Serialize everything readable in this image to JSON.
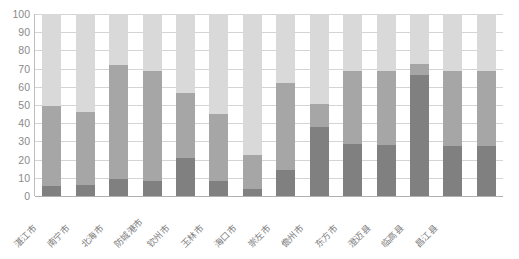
{
  "chart_data": {
    "type": "bar",
    "subtype": "stacked-bar-100-percent",
    "title": "",
    "subtitle": "",
    "xlabel": "",
    "ylabel": "",
    "ylim": [
      0,
      100
    ],
    "ytick_values": [
      0,
      10,
      20,
      30,
      40,
      50,
      60,
      70,
      80,
      90,
      100
    ],
    "ytick_labels": [
      "0",
      "10",
      "20",
      "30",
      "40",
      "50",
      "60",
      "70",
      "80",
      "90",
      "100"
    ],
    "grid": true,
    "grid_axis": "y",
    "legend": false,
    "legend_position": "none",
    "categories": [
      "湛江市",
      "南宁市",
      "北海市",
      "防城港市",
      "钦州市",
      "玉林市",
      "海口市",
      "崇左市",
      "儋州市",
      "东方市",
      "澄迈县",
      "临高县",
      "昌江县"
    ],
    "series": [
      {
        "name": "series-1",
        "color": "#808080",
        "values": [
          5.5,
          6,
          9.5,
          8.5,
          21,
          8,
          4,
          14.5,
          38,
          28.5,
          28,
          66.5,
          27.5
        ]
      },
      {
        "name": "series-2",
        "color": "#a6a6a6",
        "values": [
          44,
          40,
          62.5,
          60,
          35.5,
          37,
          18.5,
          47.5,
          12.5,
          40,
          40.5,
          6,
          41
        ]
      },
      {
        "name": "series-3",
        "color": "#d9d9d9",
        "values": [
          50.5,
          54,
          28,
          31.5,
          43.5,
          55,
          77.5,
          38,
          49.5,
          31.5,
          31.5,
          27.5,
          31.5
        ]
      }
    ],
    "cumulative_tops": [
      {
        "category": "湛江市",
        "seg1_top": 5.5,
        "seg2_top": 49.5,
        "seg3_top": 100
      },
      {
        "category": "南宁市",
        "seg1_top": 6,
        "seg2_top": 46,
        "seg3_top": 100
      },
      {
        "category": "北海市",
        "seg1_top": 9.5,
        "seg2_top": 72,
        "seg3_top": 100
      },
      {
        "category": "防城港市",
        "seg1_top": 8.5,
        "seg2_top": 68.5,
        "seg3_top": 100
      },
      {
        "category": "钦州市",
        "seg1_top": 21,
        "seg2_top": 56.5,
        "seg3_top": 100
      },
      {
        "category": "玉林市",
        "seg1_top": 8,
        "seg2_top": 45,
        "seg3_top": 100
      },
      {
        "category": "海口市",
        "seg1_top": 4,
        "seg2_top": 22.5,
        "seg3_top": 100
      },
      {
        "category": "崇左市",
        "seg1_top": 14.5,
        "seg2_top": 62,
        "seg3_top": 100
      },
      {
        "category": "儋州市",
        "seg1_top": 38,
        "seg2_top": 50.5,
        "seg3_top": 100
      },
      {
        "category": "东方市",
        "seg1_top": 28.5,
        "seg2_top": 68.5,
        "seg3_top": 100
      },
      {
        "category": "澄迈县",
        "seg1_top": 28,
        "seg2_top": 68.5,
        "seg3_top": 100
      },
      {
        "category": "临高县",
        "seg1_top": 66.5,
        "seg2_top": 72.5,
        "seg3_top": 100
      },
      {
        "category": "昌江县",
        "seg1_top": 27.5,
        "seg2_top": 68.5,
        "seg3_top": 100
      }
    ]
  },
  "colors": {
    "series_dark": "#808080",
    "series_medium": "#a6a6a6",
    "series_light": "#d9d9d9",
    "gridline": "#d4d4d4",
    "axis": "#bdbdbd",
    "tick_text": "#8a8a8a",
    "category_text": "#7d7d7d",
    "background": "#ffffff"
  }
}
